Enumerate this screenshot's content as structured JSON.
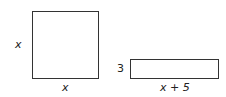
{
  "figures": {
    "square": {
      "side_left_label": "x",
      "side_bottom_label": "x"
    },
    "rectangle": {
      "height_label": "3",
      "width_label": "x + 5"
    }
  },
  "colors": {
    "stroke": "#333333",
    "background": "#ffffff"
  }
}
